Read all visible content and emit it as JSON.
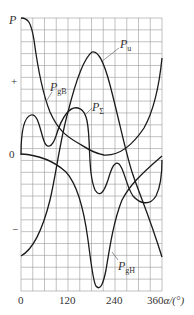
{
  "chart_data": {
    "type": "line",
    "title": "",
    "xlabel": "α/(°)",
    "ylabel": "P",
    "x_ticks": [
      "0",
      "120",
      "240",
      "360"
    ],
    "x_tick_values": [
      0,
      120,
      240,
      360
    ],
    "y_ticks": [
      "+",
      "0",
      "−"
    ],
    "xlim": [
      0,
      360
    ],
    "grid": true,
    "grid_step_x_deg": 30,
    "legend": "inline labels with leader lines",
    "series": [
      {
        "name": "P_gB",
        "label": "P",
        "label_sub": "gB",
        "x": [
          0,
          15,
          30,
          45,
          60,
          90,
          120,
          150,
          180,
          210,
          240,
          270,
          300,
          330,
          360
        ],
        "y": [
          1.0,
          0.92,
          0.62,
          0.38,
          0.22,
          0.13,
          0.08,
          0.04,
          0.01,
          0.0,
          0.03,
          0.1,
          0.2,
          0.38,
          0.72
        ]
      },
      {
        "name": "P_u",
        "label": "P",
        "label_sub": "u",
        "x": [
          0,
          30,
          60,
          90,
          120,
          150,
          180,
          210,
          240,
          270,
          300,
          330,
          360
        ],
        "y": [
          -0.74,
          -0.58,
          -0.3,
          0.1,
          0.52,
          0.76,
          0.74,
          0.4,
          -0.05,
          -0.3,
          -0.62,
          -0.86,
          -1.05
        ]
      },
      {
        "name": "P_Σ",
        "label": "P",
        "label_sub": "Σ",
        "x": [
          0,
          15,
          30,
          45,
          60,
          75,
          90,
          105,
          120,
          135,
          150,
          165,
          180,
          195,
          210,
          225,
          240,
          255,
          270,
          285,
          300,
          315,
          330,
          345,
          360
        ],
        "y": [
          0.0,
          0.27,
          0.22,
          0.06,
          0.08,
          0.2,
          0.3,
          0.32,
          0.3,
          0.15,
          0.0,
          -0.2,
          -0.3,
          -0.3,
          -0.25,
          -0.12,
          -0.06,
          -0.12,
          -0.25,
          -0.35,
          -0.38,
          -0.36,
          -0.3,
          -0.18,
          -0.02
        ]
      },
      {
        "name": "P_gH",
        "label": "P",
        "label_sub": "gH",
        "x": [
          0,
          30,
          60,
          90,
          120,
          150,
          165,
          180,
          190,
          200,
          215,
          240,
          270,
          300,
          330,
          360
        ],
        "y": [
          0.0,
          -0.02,
          -0.08,
          -0.17,
          -0.32,
          -0.58,
          -0.8,
          -1.0,
          -1.08,
          -1.0,
          -0.7,
          -0.42,
          -0.25,
          -0.15,
          -0.07,
          0.02
        ]
      }
    ]
  },
  "axes": {
    "y_symbol": "P",
    "y_plus": "+",
    "y_zero": "0",
    "y_minus": "−",
    "x_tick_0": "0",
    "x_tick_120": "120",
    "x_tick_240": "240",
    "x_tick_360": "360",
    "x_unit": "α/(°)"
  },
  "labels": {
    "P": "P",
    "gB": "gB",
    "u": "u",
    "sigma": "Σ",
    "gH": "gH"
  }
}
